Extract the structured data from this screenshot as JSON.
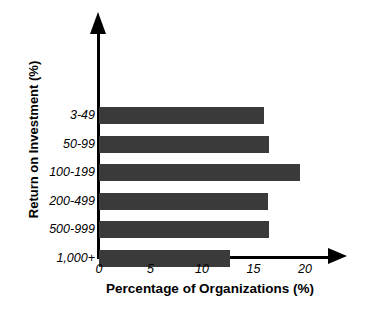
{
  "chart_data": {
    "type": "bar",
    "orientation": "horizontal",
    "title": "",
    "xlabel": "Percentage of Organizations (%)",
    "ylabel": "Return on Investment (%)",
    "categories": [
      "3-49",
      "50-99",
      "100-199",
      "200-499",
      "500-999",
      "1,000+"
    ],
    "values": [
      16.0,
      16.5,
      19.5,
      16.4,
      16.5,
      12.7
    ],
    "xticks": [
      "0",
      "5",
      "10",
      "15",
      "20"
    ],
    "xtick_values": [
      0,
      5,
      10,
      15,
      20
    ],
    "xlim": [
      0,
      20
    ],
    "grid": false,
    "legend": false,
    "bar_color": "#3a3a3a",
    "axis_color": "#000000"
  },
  "axes": {
    "y_arrow": "up-arrow-icon",
    "x_arrow": "right-arrow-icon"
  }
}
